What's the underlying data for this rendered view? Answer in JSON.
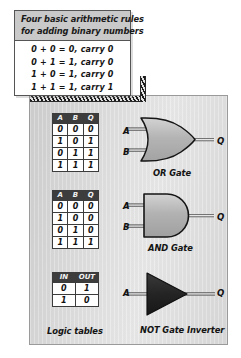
{
  "figure": {
    "rules_box": {
      "title_lines": [
        "Four basic arithmetic rules",
        "for adding binary numbers"
      ],
      "rules": [
        "0 + 0 = 0,  carry  0",
        "0 + 1 = 1,  carry  0",
        "1 + 0 = 1,  carry  0",
        "1 + 1 = 1,  carry  1"
      ]
    },
    "logic_tables_caption": "Logic tables",
    "tables": [
      {
        "id": "or",
        "headers": [
          "A",
          "B",
          "Q"
        ],
        "rows": [
          [
            "0",
            "0",
            "0"
          ],
          [
            "1",
            "0",
            "1"
          ],
          [
            "0",
            "1",
            "1"
          ],
          [
            "1",
            "1",
            "1"
          ]
        ]
      },
      {
        "id": "and",
        "headers": [
          "A",
          "B",
          "Q"
        ],
        "rows": [
          [
            "0",
            "0",
            "0"
          ],
          [
            "1",
            "0",
            "0"
          ],
          [
            "0",
            "1",
            "0"
          ],
          [
            "1",
            "1",
            "1"
          ]
        ]
      },
      {
        "id": "not",
        "headers": [
          "IN",
          "OUT"
        ],
        "rows": [
          [
            "0",
            "1"
          ],
          [
            "1",
            "0"
          ]
        ]
      }
    ],
    "gates": [
      {
        "id": "or",
        "caption": "OR Gate",
        "inputs": [
          "A",
          "B"
        ],
        "output": "Q"
      },
      {
        "id": "and",
        "caption": "AND Gate",
        "inputs": [
          "A",
          "B"
        ],
        "output": "Q"
      },
      {
        "id": "not",
        "caption": "NOT Gate Inverter",
        "inputs": [
          "A"
        ],
        "output": "Q"
      }
    ],
    "colors": {
      "panel_gray": "#dcdcdc",
      "header_gray": "#c9c9c9",
      "table_header_dark": "#3d3d3d",
      "gate_fill": "#b9b9b9",
      "not_gate_fill": "#2b2b2b",
      "outline": "#1a1a1a",
      "page_white": "#ffffff"
    }
  }
}
